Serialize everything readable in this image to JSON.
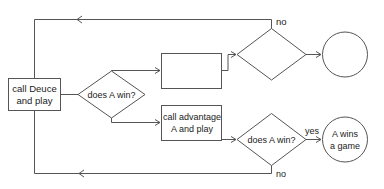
{
  "diagram": {
    "type": "flowchart",
    "nodes": {
      "deuce": {
        "shape": "rectangle",
        "line1": "call Deuce",
        "line2": "and play"
      },
      "decision1": {
        "shape": "diamond",
        "label": "does A win?"
      },
      "upper_box": {
        "shape": "rectangle",
        "label": ""
      },
      "upper_decision": {
        "shape": "diamond",
        "label": ""
      },
      "upper_circle": {
        "shape": "circle",
        "label": ""
      },
      "advantage": {
        "shape": "rectangle",
        "line1": "call advantage",
        "line2": "A and play"
      },
      "decision2": {
        "shape": "diamond",
        "label": "does A win?"
      },
      "win": {
        "shape": "circle",
        "line1": "A wins",
        "line2": "a game"
      }
    },
    "edges": {
      "top_no": {
        "label": "no",
        "from": "upper_decision",
        "to": "deuce"
      },
      "lower_yes": {
        "label": "yes",
        "from": "decision2",
        "to": "win"
      },
      "lower_no": {
        "label": "no",
        "from": "decision2",
        "to": "deuce"
      }
    },
    "colors": {
      "stroke": "#555555",
      "text": "#222222",
      "background": "#ffffff"
    }
  }
}
